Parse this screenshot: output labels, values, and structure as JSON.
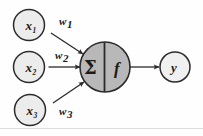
{
  "diagram": {
    "type": "artificial-neuron",
    "background_color": "#fefefe",
    "stroke_color": "#2b2b2b",
    "input_node_fill": "#ececec",
    "body_node_fill": "#b8b8b8",
    "output_node_fill": "#f0f0f0",
    "inputs": [
      {
        "label": "x",
        "subscript": "1",
        "weight_label": "w",
        "weight_subscript": "1"
      },
      {
        "label": "x",
        "subscript": "2",
        "weight_label": "w",
        "weight_subscript": "2"
      },
      {
        "label": "x",
        "subscript": "3",
        "weight_label": "w",
        "weight_subscript": "3"
      }
    ],
    "body": {
      "summation_symbol": "Σ",
      "activation_symbol": "f"
    },
    "output": {
      "label": "y"
    }
  }
}
